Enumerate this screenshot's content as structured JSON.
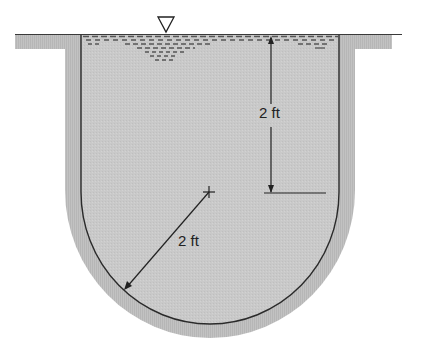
{
  "figure": {
    "type": "diagram",
    "colors": {
      "background": "#ffffff",
      "wall": "#bdbdbd",
      "liquid": "#cccccc",
      "line": "#2a2a2a",
      "ripple": "#555555"
    },
    "free_surface_symbol": "triangle-down",
    "labels": {
      "depth": "2 ft",
      "radius": "2 ft"
    },
    "dimensions": [
      {
        "name": "depth-of-straight-section",
        "value": "2 ft"
      },
      {
        "name": "radius-of-semicircular-bottom",
        "value": "2 ft"
      }
    ]
  }
}
